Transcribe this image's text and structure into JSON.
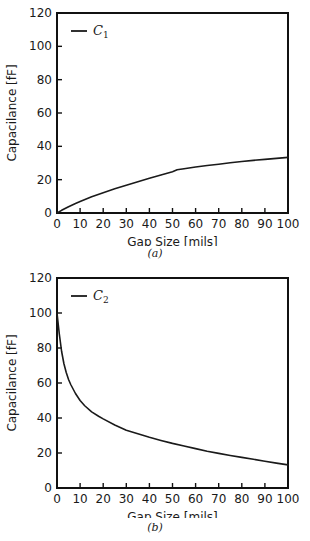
{
  "figure": {
    "panels": [
      {
        "id": "a",
        "caption": "(a)",
        "legend_label": "C",
        "legend_sub": "1"
      },
      {
        "id": "b",
        "caption": "(b)",
        "legend_label": "C",
        "legend_sub": "2"
      }
    ]
  },
  "chart_data": [
    {
      "type": "line",
      "panel": "a",
      "title": "",
      "xlabel": "Gap Size [mils]",
      "ylabel": "Capacilance [fF]",
      "xlim": [
        0,
        100
      ],
      "ylim": [
        0,
        120
      ],
      "xticks": [
        0,
        10,
        20,
        30,
        40,
        50,
        60,
        70,
        80,
        90,
        100
      ],
      "yticks": [
        0,
        20,
        40,
        60,
        80,
        100,
        120
      ],
      "xtick_labels": [
        "0",
        "10",
        "20",
        "30",
        "40",
        "50",
        "60",
        "70",
        "80",
        "90",
        "100"
      ],
      "ytick_labels": [
        "0",
        "20",
        "40",
        "60",
        "80",
        "100",
        "120"
      ],
      "grid": false,
      "legend_position": "top-left",
      "series": [
        {
          "name": "C_1",
          "x": [
            0,
            2,
            5,
            8,
            10,
            15,
            20,
            25,
            30,
            35,
            40,
            45,
            50,
            52,
            55,
            60,
            65,
            70,
            75,
            80,
            85,
            90,
            95,
            100
          ],
          "y": [
            0,
            1.6,
            3.8,
            5.7,
            6.9,
            9.7,
            12.2,
            14.5,
            16.7,
            18.8,
            20.8,
            22.8,
            24.8,
            25.9,
            26.6,
            27.6,
            28.5,
            29.3,
            30.1,
            30.9,
            31.6,
            32.2,
            32.8,
            33.4
          ]
        }
      ]
    },
    {
      "type": "line",
      "panel": "b",
      "title": "",
      "xlabel": "Gap Size [mils]",
      "ylabel": "Capacilance [fF]",
      "xlim": [
        0,
        100
      ],
      "ylim": [
        0,
        120
      ],
      "xticks": [
        0,
        10,
        20,
        30,
        40,
        50,
        60,
        70,
        80,
        90,
        100
      ],
      "yticks": [
        0,
        20,
        40,
        60,
        80,
        100,
        120
      ],
      "xtick_labels": [
        "0",
        "10",
        "20",
        "30",
        "40",
        "50",
        "60",
        "70",
        "80",
        "90",
        "100"
      ],
      "ytick_labels": [
        "0",
        "20",
        "40",
        "60",
        "80",
        "100",
        "120"
      ],
      "grid": false,
      "legend_position": "top-left",
      "series": [
        {
          "name": "C_2",
          "x": [
            0,
            1,
            2,
            3,
            4,
            5,
            6,
            8,
            10,
            12,
            15,
            18,
            20,
            25,
            30,
            35,
            40,
            45,
            50,
            55,
            60,
            65,
            70,
            75,
            80,
            85,
            90,
            95,
            100
          ],
          "y": [
            100,
            88,
            78,
            71,
            66,
            62,
            59,
            54,
            50,
            47,
            43.5,
            41,
            39.5,
            36,
            33,
            31,
            29,
            27.2,
            25.5,
            24,
            22.5,
            21,
            19.8,
            18.6,
            17.5,
            16.4,
            15.3,
            14.2,
            13.2
          ]
        }
      ]
    }
  ],
  "colors": {
    "curve": "#1a1a1a",
    "frame": "#111111",
    "background": "#ffffff",
    "text": "#1a1a1a"
  }
}
